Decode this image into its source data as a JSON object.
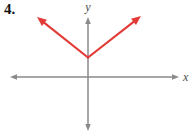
{
  "problem_number": "4.",
  "colors": {
    "background": "#ffffff",
    "axis": "#8a8a8a",
    "curve": "#e23b38",
    "label_text": "#4a4a4a",
    "number_text": "#111111"
  },
  "axes": {
    "x_label": "x",
    "y_label": "y",
    "x_axis": {
      "y": 77,
      "x_start": 10,
      "x_end": 179
    },
    "y_axis": {
      "x": 88,
      "y_start": 17,
      "y_end": 131
    },
    "stroke_width": 1.5
  },
  "curve": {
    "vertex": [
      88,
      57.5
    ],
    "left_tip": [
      37,
      17
    ],
    "right_tip": [
      141,
      16
    ],
    "stroke_width": 2.2
  },
  "labels": {
    "y_label_pos": [
      88,
      11
    ],
    "x_label_pos": [
      183,
      81
    ]
  },
  "chart_data": {
    "type": "line",
    "title": "",
    "xlabel": "x",
    "ylabel": "y",
    "series": [
      {
        "name": "red-v-graph",
        "points": [
          [
            -2.55,
            3.0
          ],
          [
            0,
            1.0
          ],
          [
            2.65,
            3.05
          ]
        ]
      }
    ],
    "xlim": [
      -3.9,
      4.55
    ],
    "ylim": [
      -2.7,
      3.0
    ],
    "grid": false,
    "legend": false
  }
}
